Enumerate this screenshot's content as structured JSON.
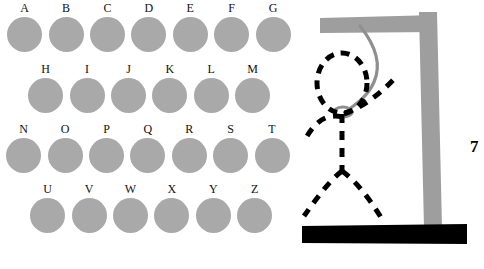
{
  "app": {
    "title": "Hangman",
    "background_color": "#ffffff"
  },
  "letter_board": {
    "disc_color": "#a9a9a9",
    "label_color": "#111111",
    "rows": [
      {
        "name": "row-1",
        "letters": [
          "A",
          "B",
          "C",
          "D",
          "E",
          "F",
          "G"
        ]
      },
      {
        "name": "row-2",
        "letters": [
          "H",
          "I",
          "J",
          "K",
          "L",
          "M"
        ]
      },
      {
        "name": "row-3",
        "letters": [
          "N",
          "O",
          "P",
          "Q",
          "R",
          "S",
          "T"
        ]
      },
      {
        "name": "row-4",
        "letters": [
          "U",
          "V",
          "W",
          "X",
          "Y",
          "Z"
        ]
      }
    ]
  },
  "gallows": {
    "frame_color": "#9e9e9e",
    "base_color": "#000000",
    "rope_color": "#8f8f8f",
    "figure_color": "#000000",
    "parts_drawn": [
      "head",
      "body",
      "left-arm",
      "right-arm",
      "left-leg",
      "right-leg"
    ]
  },
  "counter": {
    "label": "7",
    "color": "#000000"
  }
}
